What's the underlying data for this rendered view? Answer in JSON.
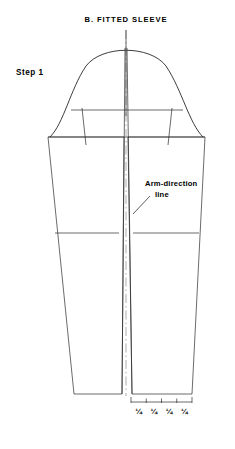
{
  "page": {
    "width": 235,
    "height": 449,
    "background": "#ffffff",
    "ink_color": "#1a1a1a",
    "grain_color": "#9a9a9a"
  },
  "title": "B.  FITTED  SLEEVE",
  "step_label": "Step 1",
  "callout": {
    "line1": "Arm-direction",
    "line2": "line"
  },
  "measurements": {
    "tick_labels": [
      "¼",
      "¼",
      "¼",
      "¼"
    ],
    "count": 4
  },
  "diagram": {
    "type": "sewing-pattern-sleeve-draft",
    "center_x": 126,
    "cap_apex_y": 46,
    "cap_line_y": 110,
    "body_top_y": 137,
    "elbow_line_y": 233,
    "hem_y": 394,
    "body_left_top_x": 48,
    "body_right_top_x": 205,
    "body_left_hem_x": 74,
    "body_right_hem_x": 192,
    "split_gap": [
      122,
      132
    ],
    "center_guide_top_y": 30,
    "center_guide_bottom_y": 396,
    "scale_bar_y": 402,
    "scale_bar_x1": 131,
    "scale_bar_x2": 192,
    "notch_left_x": 83,
    "notch_right_x": 171
  }
}
